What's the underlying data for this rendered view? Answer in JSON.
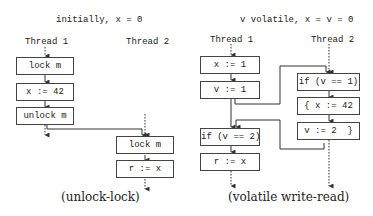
{
  "left": {
    "header": "initially, x = 0",
    "thread1_label": "Thread 1",
    "thread2_label": "Thread 2",
    "thread1_boxes": [
      "lock m",
      "x := 42",
      "unlock m"
    ],
    "thread2_boxes": [
      "lock m",
      "r := x"
    ],
    "caption": "(unlock-lock)"
  },
  "right": {
    "header": "v volatile, x = v = 0",
    "thread1_label": "Thread 1",
    "thread2_label": "Thread 2",
    "thread1_boxes": [
      "x := 1",
      "v := 1",
      "if (v == 2)",
      "r := x"
    ],
    "thread2_boxes": [
      "if (v == 1)",
      "{ x := 42",
      "v := 2  }"
    ],
    "caption": "(volatile write-read)"
  }
}
